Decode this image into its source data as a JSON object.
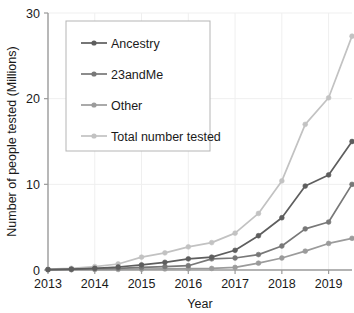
{
  "chart_data": {
    "type": "line",
    "title": "",
    "xlabel": "Year",
    "ylabel": "Number of people tested (Millions)",
    "xlim": [
      2013,
      2019.5
    ],
    "ylim": [
      0,
      30
    ],
    "yticks": [
      0,
      10,
      20,
      30
    ],
    "ytick_labels": [
      "0",
      "10",
      "20",
      "30"
    ],
    "xticks": [
      2013,
      2014,
      2015,
      2016,
      2017,
      2018,
      2019
    ],
    "xtick_labels": [
      "2013",
      "2014",
      "2015",
      "2016",
      "2017",
      "2018",
      "2019"
    ],
    "grid": true,
    "legend_position": "upper left",
    "x": [
      2013,
      2013.5,
      2014,
      2014.5,
      2015,
      2015.5,
      2016,
      2016.5,
      2017,
      2017.5,
      2018,
      2018.5,
      2019,
      2019.5
    ],
    "series": [
      {
        "name": "Ancestry",
        "color": "#5e5e5e",
        "values": [
          0.05,
          0.1,
          0.2,
          0.35,
          0.6,
          0.9,
          1.3,
          1.5,
          2.3,
          4.0,
          6.1,
          9.8,
          11.1,
          15.0
        ]
      },
      {
        "name": "23andMe",
        "color": "#787878",
        "values": [
          0.05,
          0.08,
          0.15,
          0.2,
          0.3,
          0.4,
          0.5,
          1.3,
          1.4,
          1.8,
          2.8,
          4.8,
          5.6,
          10.0
        ]
      },
      {
        "name": "Other",
        "color": "#9b9b9b",
        "values": [
          0.02,
          0.03,
          0.05,
          0.07,
          0.1,
          0.12,
          0.15,
          0.18,
          0.3,
          0.8,
          1.4,
          2.2,
          3.1,
          3.7
        ]
      },
      {
        "name": "Total number tested",
        "color": "#c2c2c2",
        "values": [
          0.1,
          0.2,
          0.4,
          0.7,
          1.5,
          2.0,
          2.7,
          3.2,
          4.3,
          6.6,
          10.4,
          17.0,
          20.1,
          27.3
        ]
      }
    ]
  },
  "legend": {
    "entries": [
      {
        "label": "Ancestry"
      },
      {
        "label": "23andMe"
      },
      {
        "label": "Other"
      },
      {
        "label": "Total number tested"
      }
    ]
  }
}
